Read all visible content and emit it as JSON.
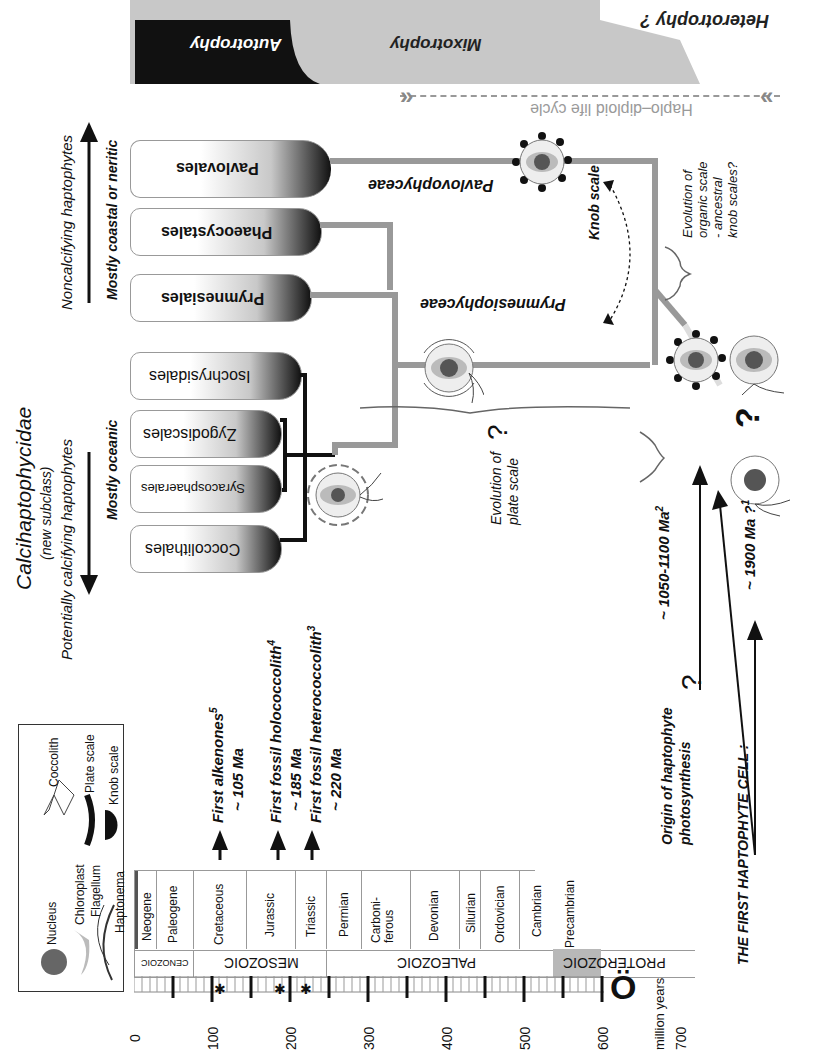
{
  "title": {
    "clade": "Calcihaptophycidae",
    "clade_note": "(new subclass)",
    "calcifying": "Potentially calcifying haptophytes",
    "noncalcifying": "Noncalcifying haptophytes",
    "oceanic": "Mostly oceanic",
    "coastal": "Mostly coastal or neritic"
  },
  "nutrition_band": {
    "autotrophy": "Autotrophy",
    "mixotrophy": "Mixotrophy",
    "heterotrophy": "Heterotrophy ?",
    "colors": {
      "autotrophy": "#111111",
      "mixotrophy": "#c8c8c8",
      "heterotrophy": "#ffffff"
    }
  },
  "life_cycle": {
    "label": "Haplo–diploid life cycle"
  },
  "taxa": [
    {
      "name": "Coccolithales"
    },
    {
      "name": "Syracosphaerales"
    },
    {
      "name": "Zygodiscales"
    },
    {
      "name": "Isochrysidales"
    },
    {
      "name": "Prymnesiales"
    },
    {
      "name": "Phaeocystales"
    },
    {
      "name": "Pavlovales"
    }
  ],
  "classes": {
    "prymnesiophyceae": "Prymnesiophyceae",
    "pavlovophyceae": "Pavlovophyceae"
  },
  "annotations": {
    "knob_scale": "Knob scale",
    "organic_scale": [
      "Evolution of",
      "organic scale",
      "- ancestral",
      "knob scales?"
    ],
    "plate_scale": [
      "Evolution of",
      "plate scale"
    ],
    "question": "?",
    "photosynthesis": [
      "Origin of haptophyte",
      "photosynthesis"
    ],
    "photosynthesis_age": "~ 1050-1100 Ma",
    "photosynthesis_ref": "2",
    "first_cell": "THE FIRST HAPTOPHYTE CELL :",
    "first_cell_age": "~ 1900 Ma ?",
    "first_cell_ref": "1"
  },
  "fossil_events": [
    {
      "label": "First alkenones",
      "ref": "5",
      "age": "~ 105 Ma",
      "ma": 105
    },
    {
      "label": "First fossil holococcolith",
      "ref": "4",
      "age": "~ 185 Ma",
      "ma": 185
    },
    {
      "label": "First fossil heterococcolith",
      "ref": "3",
      "age": "~ 220 Ma",
      "ma": 220
    }
  ],
  "legend": {
    "nucleus": "Nucleus",
    "chloroplast": "Chloroplast",
    "flagellum": "Flagellum",
    "haptonema": "Haptonema",
    "coccolith": "Coccolith",
    "plate_scale": "Plate scale",
    "knob_scale": "Knob scale"
  },
  "timescale": {
    "unit": "million years",
    "ticks": [
      "0",
      "100",
      "200",
      "300",
      "400",
      "500",
      "600",
      "700"
    ],
    "eras": [
      {
        "name": "CENOZOIC",
        "start": 0,
        "end": 66
      },
      {
        "name": "MESOZOIC",
        "start": 66,
        "end": 252
      },
      {
        "name": "PALEOZOIC",
        "start": 252,
        "end": 541
      },
      {
        "name": "PROTEROZOIC",
        "start": 541,
        "end": 700
      }
    ],
    "periods": [
      {
        "name": "Neogene",
        "start": 0,
        "end": 23
      },
      {
        "name": "Paleogene",
        "start": 23,
        "end": 66
      },
      {
        "name": "Cretaceous",
        "start": 66,
        "end": 145
      },
      {
        "name": "Jurassic",
        "start": 145,
        "end": 201
      },
      {
        "name": "Triassic",
        "start": 201,
        "end": 252
      },
      {
        "name": "Permian",
        "start": 252,
        "end": 299
      },
      {
        "name": "Carboni-ferous",
        "start": 299,
        "end": 359
      },
      {
        "name": "Devonian",
        "start": 359,
        "end": 419
      },
      {
        "name": "Silurian",
        "start": 419,
        "end": 444
      },
      {
        "name": "Ordovician",
        "start": 444,
        "end": 485
      },
      {
        "name": "Cambrian",
        "start": 485,
        "end": 541
      },
      {
        "name": "Precambrian",
        "start": 541,
        "end": 700
      }
    ],
    "stars_ma": [
      105,
      185,
      220
    ]
  }
}
